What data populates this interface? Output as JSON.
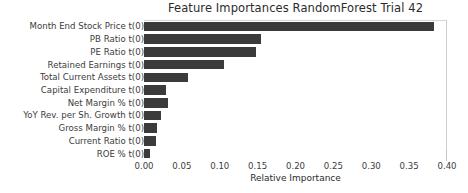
{
  "chart_data": {
    "type": "bar",
    "orientation": "horizontal",
    "title": "Feature Importances RandomForest Trial 42",
    "xlabel": "Relative Importance",
    "ylabel": "",
    "grid": false,
    "legend": null,
    "xlim": [
      0.0,
      0.4
    ],
    "xticks": [
      "0.00",
      "0.05",
      "0.10",
      "0.15",
      "0.20",
      "0.25",
      "0.30",
      "0.35",
      "0.40"
    ],
    "xtick_values": [
      0.0,
      0.05,
      0.1,
      0.15,
      0.2,
      0.25,
      0.3,
      0.35,
      0.4
    ],
    "bar_color": "#3b3b3b",
    "categories": [
      "Month End Stock Price t(0)",
      "PB Ratio t(0)",
      "PE Ratio t(0)",
      "Retained Earnings t(0)",
      "Total Current Assets t(0)",
      "Capital Expenditure t(0)",
      "Net Margin % t(0)",
      "YoY Rev. per Sh. Growth t(0)",
      "Gross Margin % t(0)",
      "Current Ratio t(0)",
      "ROE % t(0)"
    ],
    "values": [
      0.383,
      0.154,
      0.148,
      0.105,
      0.058,
      0.029,
      0.032,
      0.023,
      0.017,
      0.016,
      0.008
    ]
  }
}
